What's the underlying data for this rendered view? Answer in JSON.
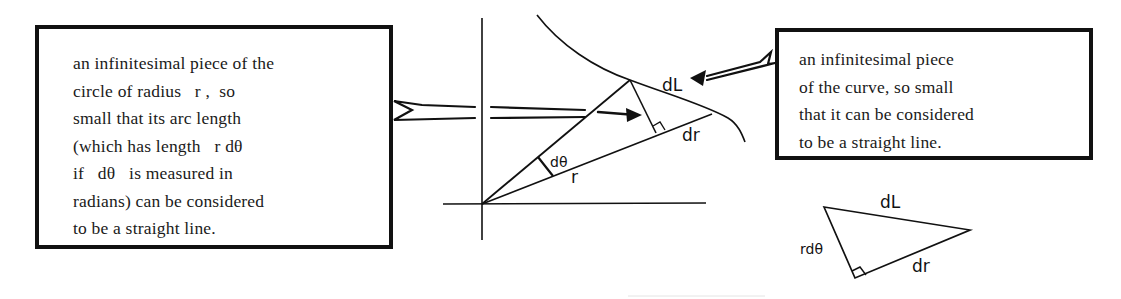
{
  "left_note": {
    "lines": [
      "an infinitesimal piece of the",
      "circle of radius   r ,  so",
      "small that its arc length",
      "(which has length   r dθ",
      "if   dθ   is measured in",
      "radians) can be considered",
      "to be a straight line."
    ]
  },
  "right_note": {
    "lines": [
      "an infinitesimal piece",
      "of the curve, so small",
      "that it can be considered",
      "to be a straight line."
    ]
  },
  "main_figure": {
    "labels": {
      "dL": "dL",
      "dr": "dr",
      "dtheta": "dθ",
      "r": "r"
    }
  },
  "small_triangle": {
    "labels": {
      "hypotenuse": "dL",
      "base": "dr",
      "height": "rdθ"
    }
  },
  "colors": {
    "ink": "#111111",
    "background": "#ffffff"
  }
}
